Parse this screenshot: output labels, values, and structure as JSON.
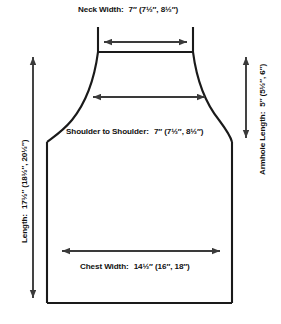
{
  "diagram": {
    "type": "technical-drawing",
    "units": "inches",
    "size_note": "base size with (size 2, size 3) alternates in parentheses",
    "measurements": [
      {
        "id": "neck-width",
        "label": "Neck Width:",
        "value": "7″ (7½″, 8½″)",
        "orientation": "horizontal",
        "base": "7″",
        "alternates": [
          "7½″",
          "8½″"
        ]
      },
      {
        "id": "shoulder-to-shoulder",
        "label": "Shoulder to Shoulder:",
        "value": "7″ (7½″, 8½″)",
        "orientation": "horizontal",
        "base": "7″",
        "alternates": [
          "7½″",
          "8½″"
        ]
      },
      {
        "id": "chest-width",
        "label": "Chest Width:",
        "value": "14½″ (16″, 18″)",
        "orientation": "horizontal",
        "base": "14½″",
        "alternates": [
          "16″",
          "18″"
        ]
      },
      {
        "id": "length",
        "label": "Length:",
        "value": "17½″ (18½″, 20½″)",
        "orientation": "vertical-left",
        "base": "17½″",
        "alternates": [
          "18½″",
          "20½″"
        ]
      },
      {
        "id": "armhole-length",
        "label": "Armhole Length:",
        "value": "5″ (5½″, 6″)",
        "orientation": "vertical-right",
        "base": "5″",
        "alternates": [
          "5½″",
          "6″"
        ]
      }
    ],
    "colors": {
      "outline": "#1a1a1a",
      "arrow": "#3a3a3a",
      "text": "#111111",
      "background": "#ffffff"
    }
  }
}
